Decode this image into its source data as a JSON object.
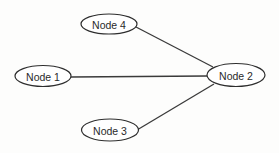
{
  "diagram": {
    "type": "undirected-graph",
    "background": "#fdfdfc",
    "stroke_color": "#2e2e2e",
    "nodes": [
      {
        "id": "node1",
        "label": "Node 1",
        "cx": 43,
        "cy": 76,
        "rx": 28,
        "ry": 10.5
      },
      {
        "id": "node2",
        "label": "Node 2",
        "cx": 236,
        "cy": 75,
        "rx": 29,
        "ry": 11.5
      },
      {
        "id": "node3",
        "label": "Node 3",
        "cx": 110,
        "cy": 130,
        "rx": 28.5,
        "ry": 11
      },
      {
        "id": "node4",
        "label": "Node 4",
        "cx": 109,
        "cy": 24,
        "rx": 28,
        "ry": 10
      }
    ],
    "edges": [
      {
        "from": "node4",
        "to": "node2",
        "x1": 136,
        "y1": 27,
        "x2": 213,
        "y2": 67
      },
      {
        "from": "node1",
        "to": "node2",
        "x1": 71,
        "y1": 77,
        "x2": 207,
        "y2": 76
      },
      {
        "from": "node3",
        "to": "node2",
        "x1": 137,
        "y1": 130,
        "x2": 214,
        "y2": 84
      }
    ]
  }
}
